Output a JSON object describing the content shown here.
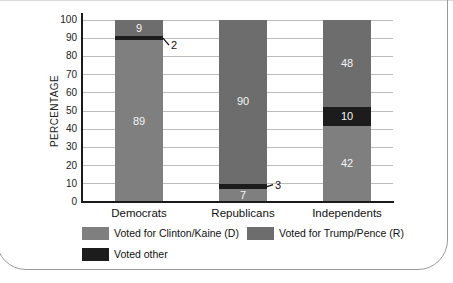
{
  "chart_data": {
    "type": "bar",
    "stacked": true,
    "title": "",
    "xlabel": "",
    "ylabel": "PERCENTAGE",
    "ylim": [
      0,
      100
    ],
    "yticks": [
      0,
      10,
      20,
      30,
      40,
      50,
      60,
      70,
      80,
      90,
      100
    ],
    "grid": true,
    "categories": [
      "Democrats",
      "Republicans",
      "Independents"
    ],
    "series": [
      {
        "name": "Voted for Clinton/Kaine (D)",
        "color": "#7f7f7f",
        "values": [
          89,
          7,
          42
        ],
        "label_placement": [
          "inside",
          "inside",
          "inside"
        ]
      },
      {
        "name": "Voted other",
        "color": "#1c1c1c",
        "values": [
          2,
          3,
          10
        ],
        "label_placement": [
          "callout",
          "callout",
          "inside"
        ]
      },
      {
        "name": "Voted for Trump/Pence (R)",
        "color": "#6d6d6d",
        "values": [
          9,
          90,
          48
        ],
        "label_placement": [
          "inside",
          "inside",
          "inside"
        ]
      }
    ],
    "legend_position": "bottom",
    "legend": [
      {
        "label": "Voted for Clinton/Kaine (D)",
        "color": "#7f7f7f"
      },
      {
        "label": "Voted for Trump/Pence (R)",
        "color": "#6d6d6d"
      },
      {
        "label": "Voted other",
        "color": "#1c1c1c"
      }
    ],
    "colors": {
      "value_label_inside": "#f4f4f4",
      "axis": "#1a1a1a",
      "gridline": "#bcbcbc",
      "panel_border": "#9a9a9a",
      "callout_line": "#111111"
    }
  }
}
